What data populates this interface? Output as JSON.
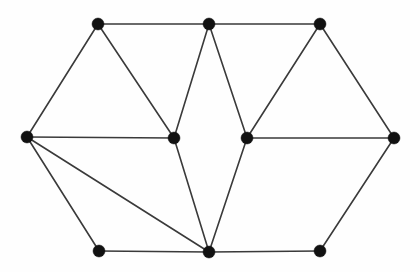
{
  "figure": {
    "kind": "planar-graph-drawing",
    "background_color": "#fefefe",
    "stroke_color": "#3a3a3a",
    "vertex_color": "#111111",
    "vertex_radius": 6,
    "edge_width": 1.6,
    "width": 420,
    "height": 272
  },
  "graph": {
    "vertex_count": 10,
    "edge_count": 17,
    "vertices": [
      {
        "id": "top-left",
        "label": "",
        "x": 98,
        "y": 24
      },
      {
        "id": "top-middle",
        "label": "",
        "x": 209,
        "y": 24
      },
      {
        "id": "top-right",
        "label": "",
        "x": 320,
        "y": 24
      },
      {
        "id": "left",
        "label": "",
        "x": 27,
        "y": 137
      },
      {
        "id": "center-left",
        "label": "",
        "x": 174,
        "y": 138
      },
      {
        "id": "center-right",
        "label": "",
        "x": 247,
        "y": 138
      },
      {
        "id": "right",
        "label": "",
        "x": 394,
        "y": 138
      },
      {
        "id": "bottom-left",
        "label": "",
        "x": 99,
        "y": 251
      },
      {
        "id": "bottom-middle",
        "label": "",
        "x": 209,
        "y": 252
      },
      {
        "id": "bottom-right",
        "label": "",
        "x": 320,
        "y": 251
      }
    ],
    "edges": [
      {
        "from": "top-left",
        "to": "top-middle"
      },
      {
        "from": "top-middle",
        "to": "top-right"
      },
      {
        "from": "top-left",
        "to": "left"
      },
      {
        "from": "top-left",
        "to": "center-left"
      },
      {
        "from": "top-middle",
        "to": "center-left"
      },
      {
        "from": "top-middle",
        "to": "center-right"
      },
      {
        "from": "top-right",
        "to": "center-right"
      },
      {
        "from": "top-right",
        "to": "right"
      },
      {
        "from": "left",
        "to": "center-left"
      },
      {
        "from": "center-right",
        "to": "right"
      },
      {
        "from": "left",
        "to": "bottom-left"
      },
      {
        "from": "left",
        "to": "bottom-middle"
      },
      {
        "from": "center-left",
        "to": "bottom-middle"
      },
      {
        "from": "center-right",
        "to": "bottom-middle"
      },
      {
        "from": "bottom-left",
        "to": "bottom-middle"
      },
      {
        "from": "bottom-middle",
        "to": "bottom-right"
      },
      {
        "from": "bottom-right",
        "to": "right"
      }
    ]
  }
}
